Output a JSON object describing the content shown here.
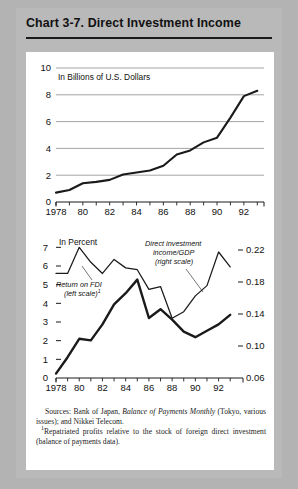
{
  "header": {
    "chart_number": "Chart 3-7.",
    "title": "Chart 3-7.  Direct Investment Income"
  },
  "colors": {
    "page_background": "#b3b3b3",
    "panel_background": "#ffffff",
    "gridline": "#9a9a9a",
    "axis": "#1a1a1a",
    "series_line": "#1a1a1a",
    "text": "#111111"
  },
  "notes": {
    "sources_prefix": "Sources: Bank of Japan, ",
    "sources_italic": "Balance of Payments Monthly",
    "sources_suffix": " (Tokyo, various issues); and Nikkei Telecom.",
    "footnote_marker": "1",
    "footnote_text": "Repatriated profits relative to the stock of foreign direct investment (balance of payments data)."
  },
  "chart_data": [
    {
      "type": "line",
      "id": "top-panel",
      "title": "",
      "unit_label": "In Billions of U.S. Dollars",
      "xlabel": "",
      "ylabel": "",
      "ylim": [
        0,
        10
      ],
      "yticks": [
        0,
        2,
        4,
        6,
        8,
        10
      ],
      "ytick_labels": [
        "0",
        "2",
        "4",
        "6",
        "8",
        "10"
      ],
      "grid": true,
      "xlim": [
        1978,
        1993.5
      ],
      "xticks": [
        1978,
        1979,
        1980,
        1981,
        1982,
        1983,
        1984,
        1985,
        1986,
        1987,
        1988,
        1989,
        1990,
        1991,
        1992,
        1993
      ],
      "xtick_labels": [
        "1978",
        "",
        "80",
        "",
        "82",
        "",
        "84",
        "",
        "86",
        "",
        "88",
        "",
        "90",
        "",
        "92",
        ""
      ],
      "x": [
        1978,
        1979,
        1980,
        1981,
        1982,
        1983,
        1984,
        1985,
        1986,
        1987,
        1988,
        1989,
        1990,
        1991,
        1992,
        1993
      ],
      "values": [
        0.7,
        0.9,
        1.4,
        1.5,
        1.65,
        2.05,
        2.2,
        2.35,
        2.7,
        3.55,
        3.85,
        4.45,
        4.8,
        6.3,
        7.9,
        8.3
      ],
      "series_name": "Direct investment income"
    },
    {
      "type": "line",
      "id": "bottom-panel",
      "title": "",
      "unit_label": "In Percent",
      "xlabel": "",
      "ylim": [
        0,
        7.5
      ],
      "yticks": [
        0,
        1,
        2,
        3,
        4,
        5,
        6,
        7
      ],
      "ytick_labels": [
        "0",
        "1",
        "2",
        "3",
        "4",
        "5",
        "6",
        "7"
      ],
      "y2lim": [
        0.06,
        0.235
      ],
      "y2ticks": [
        0.06,
        0.1,
        0.14,
        0.18,
        0.22
      ],
      "y2tick_labels": [
        "0.06",
        "0.10",
        "0.14",
        "0.18",
        "0.22"
      ],
      "grid": false,
      "xlim": [
        1978,
        1993.5
      ],
      "xticks": [
        1978,
        1979,
        1980,
        1981,
        1982,
        1983,
        1984,
        1985,
        1986,
        1987,
        1988,
        1989,
        1990,
        1991,
        1992,
        1993
      ],
      "xtick_labels": [
        "1978",
        "",
        "80",
        "",
        "82",
        "",
        "84",
        "",
        "86",
        "",
        "88",
        "",
        "90",
        "",
        "92",
        ""
      ],
      "x": [
        1978,
        1979,
        1980,
        1981,
        1982,
        1983,
        1984,
        1985,
        1986,
        1987,
        1988,
        1989,
        1990,
        1991,
        1992,
        1993
      ],
      "series": [
        {
          "name": "Return on FDI (left scale)",
          "axis": "left",
          "style": "thin",
          "label_line1": "Return on FDI",
          "label_line2": "(left scale)",
          "label_footnote": "1",
          "values": [
            5.6,
            5.6,
            7.0,
            6.2,
            5.6,
            6.35,
            5.9,
            5.8,
            4.75,
            4.9,
            3.2,
            3.55,
            4.4,
            4.95,
            6.75,
            5.95
          ]
        },
        {
          "name": "Direct investment income/GDP (right scale)",
          "axis": "right",
          "style": "thick",
          "label_line1": "Direct investment",
          "label_line2": "income/GDP",
          "label_line3": "(right scale)",
          "values": [
            0.0655,
            0.086,
            0.109,
            0.107,
            0.127,
            0.152,
            0.166,
            0.183,
            0.135,
            0.146,
            0.133,
            0.118,
            0.111,
            0.119,
            0.127,
            0.139
          ]
        }
      ]
    }
  ]
}
